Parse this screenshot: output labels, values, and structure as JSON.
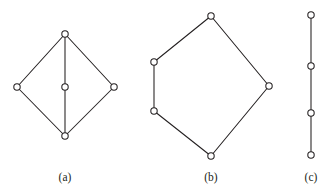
{
  "figure": {
    "background_color": "#ffffff",
    "stroke_color": "#231f20",
    "vertex_fill_color": "#ffffff",
    "width": 329,
    "height": 196,
    "vertex_radius": 3.2,
    "panels": [
      {
        "id": "panel-a",
        "caption": "(a)",
        "caption_x": 65,
        "caption_y": 178,
        "description": "diamond with vertical diagonal through center vertex",
        "vertices": [
          {
            "name": "a-top",
            "x": 65,
            "y": 34
          },
          {
            "name": "a-left",
            "x": 17,
            "y": 87
          },
          {
            "name": "a-center",
            "x": 65,
            "y": 87
          },
          {
            "name": "a-right",
            "x": 114,
            "y": 87
          },
          {
            "name": "a-bottom",
            "x": 65,
            "y": 136
          }
        ],
        "edges": [
          {
            "from": "a-top",
            "to": "a-left"
          },
          {
            "from": "a-top",
            "to": "a-right"
          },
          {
            "from": "a-top",
            "to": "a-center"
          },
          {
            "from": "a-center",
            "to": "a-bottom"
          },
          {
            "from": "a-left",
            "to": "a-bottom"
          },
          {
            "from": "a-right",
            "to": "a-bottom"
          }
        ]
      },
      {
        "id": "panel-b",
        "caption": "(b)",
        "caption_x": 211,
        "caption_y": 178,
        "description": "five-vertex cycle, irregular pentagon",
        "vertices": [
          {
            "name": "b-top",
            "x": 211,
            "y": 16
          },
          {
            "name": "b-upper-left",
            "x": 154,
            "y": 62
          },
          {
            "name": "b-lower-left",
            "x": 154,
            "y": 111
          },
          {
            "name": "b-bottom",
            "x": 211,
            "y": 156
          },
          {
            "name": "b-right",
            "x": 269,
            "y": 86
          }
        ],
        "edges": [
          {
            "from": "b-top",
            "to": "b-upper-left"
          },
          {
            "from": "b-upper-left",
            "to": "b-lower-left"
          },
          {
            "from": "b-lower-left",
            "to": "b-bottom"
          },
          {
            "from": "b-bottom",
            "to": "b-right"
          },
          {
            "from": "b-right",
            "to": "b-top"
          }
        ]
      },
      {
        "id": "panel-c",
        "caption": "(c)",
        "caption_x": 311,
        "caption_y": 178,
        "description": "vertical path with four vertices",
        "vertices": [
          {
            "name": "c-v1",
            "x": 311,
            "y": 15
          },
          {
            "name": "c-v2",
            "x": 311,
            "y": 66
          },
          {
            "name": "c-v3",
            "x": 311,
            "y": 113
          },
          {
            "name": "c-v4",
            "x": 311,
            "y": 155
          }
        ],
        "edges": [
          {
            "from": "c-v1",
            "to": "c-v2"
          },
          {
            "from": "c-v2",
            "to": "c-v3"
          },
          {
            "from": "c-v3",
            "to": "c-v4"
          }
        ]
      }
    ]
  }
}
